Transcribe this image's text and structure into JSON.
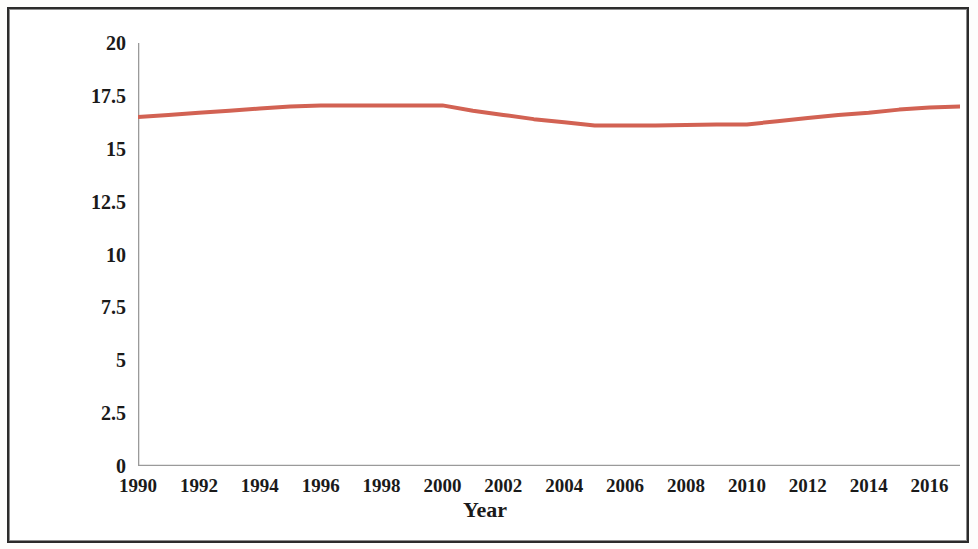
{
  "chart_data": {
    "type": "line",
    "title": "",
    "xlabel": "Year",
    "ylabel": "Share of renewables, %",
    "xlim": [
      1990,
      2017
    ],
    "ylim": [
      0,
      20
    ],
    "grid": false,
    "legend": null,
    "line_color": "#d26253",
    "line_width": 4,
    "x_ticks": [
      1990,
      1992,
      1994,
      1996,
      1998,
      2000,
      2002,
      2004,
      2006,
      2008,
      2010,
      2012,
      2014,
      2016
    ],
    "x_tick_labels": [
      "1990",
      "1992",
      "1994",
      "1996",
      "1998",
      "2000",
      "2002",
      "2004",
      "2006",
      "2008",
      "2010",
      "2012",
      "2014",
      "2016"
    ],
    "y_ticks": [
      0,
      2.5,
      5,
      7.5,
      10,
      12.5,
      15,
      17.5,
      20
    ],
    "y_tick_labels": [
      "0",
      "2.5",
      "5",
      "7.5",
      "10",
      "12.5",
      "15",
      "17.5",
      "20"
    ],
    "series": [
      {
        "name": "Share of renewables",
        "x": [
          1990,
          1991,
          1992,
          1993,
          1994,
          1995,
          1996,
          1997,
          1998,
          1999,
          2000,
          2001,
          2002,
          2003,
          2004,
          2005,
          2006,
          2007,
          2008,
          2009,
          2010,
          2011,
          2012,
          2013,
          2014,
          2015,
          2016,
          2017
        ],
        "values": [
          16.5,
          16.6,
          16.7,
          16.8,
          16.9,
          17.0,
          17.05,
          17.05,
          17.05,
          17.05,
          17.05,
          16.8,
          16.6,
          16.4,
          16.25,
          16.1,
          16.1,
          16.1,
          16.12,
          16.15,
          16.15,
          16.3,
          16.45,
          16.6,
          16.7,
          16.85,
          16.95,
          17.0
        ]
      }
    ]
  },
  "figure": {
    "frame_color": "#2b2b2b",
    "background": "#ffffff"
  }
}
